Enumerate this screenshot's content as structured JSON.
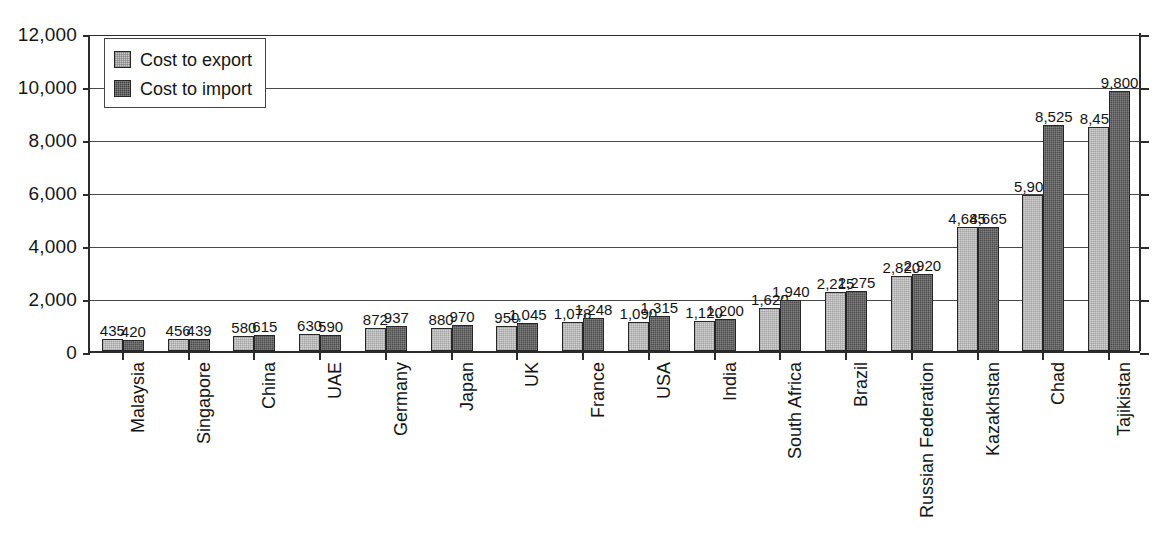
{
  "chart_data": {
    "type": "bar",
    "title": "",
    "subtitle": "",
    "xlabel": "",
    "ylabel": "",
    "ylim": [
      0,
      12000
    ],
    "ytick_labels": [
      "12,000",
      "10,000",
      "8,000",
      "6,000",
      "4,000",
      "2,000",
      "0"
    ],
    "ytick_values": [
      12000,
      10000,
      8000,
      6000,
      4000,
      2000,
      0
    ],
    "grid": true,
    "legend_position": "top-left",
    "categories": [
      "Malaysia",
      "Singapore",
      "China",
      "UAE",
      "Germany",
      "Japan",
      "UK",
      "France",
      "USA",
      "India",
      "South Africa",
      "Brazil",
      "Russian Federation",
      "Kazakhstan",
      "Chad",
      "Tajikistan"
    ],
    "series": [
      {
        "name": "Cost to export",
        "color": "#d4d4d4",
        "values": [
          435,
          456,
          580,
          630,
          872,
          880,
          950,
          1078,
          1090,
          1120,
          1620,
          2215,
          2820,
          4685,
          5902,
          8450
        ],
        "labels": [
          "435",
          "456",
          "580",
          "630",
          "872",
          "880",
          "950",
          "1,078",
          "1,090",
          "1,120",
          "1,620",
          "2,215",
          "2,820",
          "4,685",
          "5,902",
          "8,450"
        ]
      },
      {
        "name": "Cost to import",
        "color": "#4b4b4b",
        "values": [
          420,
          439,
          615,
          590,
          937,
          970,
          1045,
          1248,
          1315,
          1200,
          1940,
          2275,
          2920,
          4665,
          8525,
          9800
        ],
        "labels": [
          "420",
          "439",
          "615",
          "590",
          "937",
          "970",
          "1,045",
          "1,248",
          "1,315",
          "1,200",
          "1,940",
          "2,275",
          "2,920",
          "4,665",
          "8,525",
          "9,800"
        ]
      }
    ]
  },
  "legend": {
    "items": [
      {
        "label": "Cost to export"
      },
      {
        "label": "Cost to import"
      }
    ]
  }
}
